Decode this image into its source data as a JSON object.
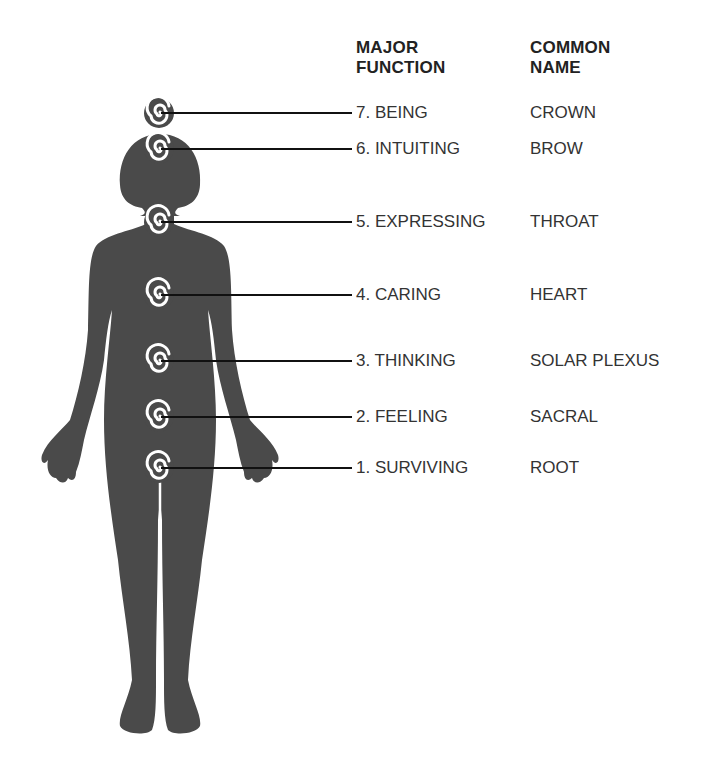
{
  "diagram": {
    "colors": {
      "silhouette": "#4a4a4a",
      "spiral": "#ffffff",
      "leader_line": "#111111",
      "text": "#333333"
    },
    "headers": {
      "function": [
        "MAJOR",
        "FUNCTION"
      ],
      "name": [
        "COMMON",
        "NAME"
      ]
    },
    "chakras": [
      {
        "number": 7,
        "function": "7. BEING",
        "name": "CROWN",
        "y": 113
      },
      {
        "number": 6,
        "function": "6. INTUITING",
        "name": "BROW",
        "y": 149
      },
      {
        "number": 5,
        "function": "5. EXPRESSING",
        "name": "THROAT",
        "y": 222
      },
      {
        "number": 4,
        "function": "4. CARING",
        "name": "HEART",
        "y": 295
      },
      {
        "number": 3,
        "function": "3. THINKING",
        "name": "SOLAR PLEXUS",
        "y": 361
      },
      {
        "number": 2,
        "function": "2. FEELING",
        "name": "SACRAL",
        "y": 417
      },
      {
        "number": 1,
        "function": "1. SURVIVING",
        "name": "ROOT",
        "y": 468
      }
    ]
  }
}
